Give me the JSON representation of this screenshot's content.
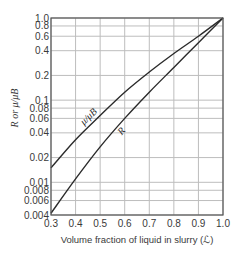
{
  "chart_data": {
    "type": "line",
    "title": "",
    "xlabel": "Volume fraction of liquid in slurry (ℒ)",
    "ylabel": "R or μ/μ_B",
    "ylabel_text": "R or μ/μB",
    "xscale": "linear",
    "yscale": "log",
    "xlim": [
      0.3,
      1.0
    ],
    "ylim": [
      0.004,
      1.0
    ],
    "grid": true,
    "x_ticks": [
      0.3,
      0.4,
      0.5,
      0.6,
      0.7,
      0.8,
      0.9,
      1.0
    ],
    "x_tick_labels": [
      "0.3",
      "0.4",
      "0.5",
      "0.6",
      "0.7",
      "0.8",
      "0.9",
      "1.0"
    ],
    "y_ticks": [
      0.004,
      0.006,
      0.008,
      0.01,
      0.02,
      0.04,
      0.06,
      0.08,
      0.1,
      0.2,
      0.4,
      0.6,
      0.8,
      1.0
    ],
    "y_tick_labels": [
      "0.004",
      "0.006",
      "0.008",
      "0.01",
      "0.02",
      "0.04",
      "0.06",
      "0.08",
      "0.1",
      "0.2",
      "0.4",
      "0.6",
      "0.8",
      "1.0"
    ],
    "x": [
      0.3,
      0.4,
      0.5,
      0.6,
      0.7,
      0.8,
      0.9,
      1.0
    ],
    "series": [
      {
        "name": "μ/μB",
        "label": "μ/μB",
        "values": [
          0.015,
          0.033,
          0.065,
          0.125,
          0.22,
          0.37,
          0.6,
          1.0
        ],
        "label_at_x": 0.47
      },
      {
        "name": "R",
        "label": "R",
        "values": [
          0.0042,
          0.011,
          0.027,
          0.06,
          0.125,
          0.25,
          0.5,
          1.0
        ],
        "label_at_x": 0.58
      }
    ]
  },
  "colors": {
    "grid": "#bdbdbd",
    "axis": "#555555",
    "curve": "#2b2b2b"
  }
}
